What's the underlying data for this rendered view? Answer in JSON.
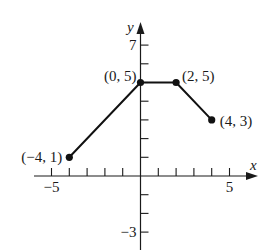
{
  "chart_data": {
    "type": "line",
    "title": "",
    "xlabel": "x",
    "ylabel": "y",
    "xlim": [
      -5,
      6
    ],
    "ylim": [
      -3,
      8
    ],
    "grid": false,
    "x_ticks": [
      -5,
      -4,
      -3,
      -2,
      -1,
      1,
      2,
      3,
      4,
      5
    ],
    "x_tick_labels": [
      {
        "value": -5,
        "label": "−5"
      },
      {
        "value": 5,
        "label": "5"
      }
    ],
    "y_ticks": [
      -3,
      -2,
      -1,
      1,
      2,
      3,
      4,
      5,
      6,
      7
    ],
    "y_tick_labels": [
      {
        "value": 7,
        "label": "7"
      },
      {
        "value": -3,
        "label": "−3"
      }
    ],
    "series": [
      {
        "name": "piecewise linear",
        "points": [
          {
            "x": -4,
            "y": 1,
            "label": "(−4, 1)"
          },
          {
            "x": 0,
            "y": 5,
            "label": "(0, 5)"
          },
          {
            "x": 2,
            "y": 5,
            "label": "(2, 5)"
          },
          {
            "x": 4,
            "y": 3,
            "label": "(4, 3)"
          }
        ]
      }
    ]
  }
}
